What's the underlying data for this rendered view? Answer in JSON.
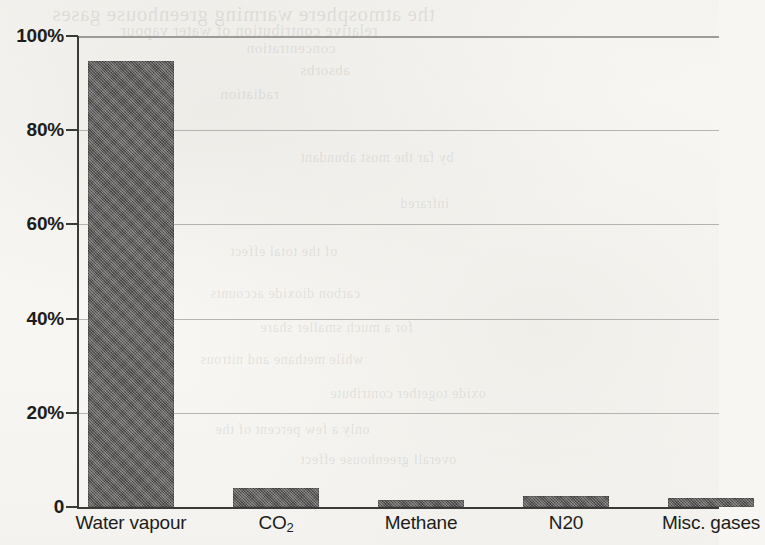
{
  "chart_data": {
    "type": "bar",
    "title": "",
    "subtitle": "",
    "xlabel": "",
    "ylabel": "",
    "categories": [
      "Water vapour",
      "CO2",
      "Methane",
      "N20",
      "Misc. gases"
    ],
    "values": [
      94.7,
      4.0,
      1.5,
      2.3,
      1.9
    ],
    "ylim": [
      0,
      100
    ],
    "ytick_values": [
      100,
      80,
      60,
      40,
      20,
      0
    ],
    "ytick_labels": [
      "100%",
      "80%",
      "60%",
      "40%",
      "20%",
      "0"
    ],
    "grid": true,
    "grid_axis": "y",
    "legend": false,
    "legend_position": "none",
    "bar_color": "#5c5b59",
    "axis_color": "#3a3a38",
    "background_color": "#f7f6f3"
  },
  "axis": {
    "y_labels": [
      {
        "text": "100%",
        "value": 100
      },
      {
        "text": "80%",
        "value": 80
      },
      {
        "text": "60%",
        "value": 60
      },
      {
        "text": "40%",
        "value": 40
      },
      {
        "text": "20%",
        "value": 20
      },
      {
        "text": "0",
        "value": 0
      }
    ],
    "x_labels": [
      {
        "text": "Water vapour",
        "html": "Water vapour"
      },
      {
        "text": "CO2",
        "html": "CO<sub>2</sub>"
      },
      {
        "text": "Methane",
        "html": "Methane"
      },
      {
        "text": "N20",
        "html": "N20"
      },
      {
        "text": "Misc. gases",
        "html": "Misc. gases"
      }
    ]
  },
  "scan_artifacts": {
    "ghost_lines": [
      "the atmosphere warming greenhouse gases",
      "relative contribution of water vapour",
      "concentration",
      "absorbs",
      "radiation",
      "by far the most abundant",
      "infrared",
      "of the total effect",
      "carbon dioxide accounts",
      "for a much smaller share",
      "while methane and nitrous",
      "oxide together contribute",
      "only a few percent of the",
      "overall greenhouse effect"
    ]
  }
}
